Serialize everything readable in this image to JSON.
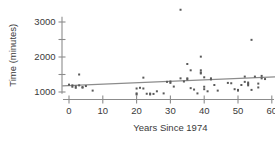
{
  "chart_data": {
    "type": "scatter",
    "title": "",
    "xlabel": "Years Since 1974",
    "ylabel": "Time (minutes)",
    "xlim": [
      -3,
      62
    ],
    "ylim": [
      700,
      3450
    ],
    "grid": false,
    "legend": "none",
    "x_ticks": [
      0,
      10,
      20,
      30,
      40,
      50,
      60
    ],
    "x_tick_labels": [
      "0",
      "10",
      "20",
      "30",
      "40",
      "50",
      "60"
    ],
    "y_ticks": [
      1000,
      1500,
      2000,
      2500,
      3000
    ],
    "y_tick_labels": [
      "1000",
      "",
      "2000",
      "",
      "3000"
    ],
    "y_major_labels": [
      "1000",
      "2000",
      "3000"
    ],
    "point_color": "#595959",
    "line_color": "#8c8c8c",
    "axis_color": "#8c8c8c",
    "trend_line": {
      "x": [
        -2,
        61
      ],
      "y": [
        1175,
        1430
      ],
      "slope": 4.05,
      "intercept": 1183
    },
    "points": [
      {
        "x": 0,
        "y": 1210
      },
      {
        "x": 1,
        "y": 1190
      },
      {
        "x": 1,
        "y": 1150
      },
      {
        "x": 2,
        "y": 1160
      },
      {
        "x": 2,
        "y": 1120
      },
      {
        "x": 3,
        "y": 1500
      },
      {
        "x": 3,
        "y": 1190
      },
      {
        "x": 4,
        "y": 1140
      },
      {
        "x": 4,
        "y": 1125
      },
      {
        "x": 5,
        "y": 1170
      },
      {
        "x": 7,
        "y": 1040
      },
      {
        "x": 20,
        "y": 1100
      },
      {
        "x": 20,
        "y": 960
      },
      {
        "x": 20,
        "y": 930
      },
      {
        "x": 21,
        "y": 1120
      },
      {
        "x": 22,
        "y": 1410
      },
      {
        "x": 22,
        "y": 1100
      },
      {
        "x": 23,
        "y": 950
      },
      {
        "x": 24,
        "y": 955
      },
      {
        "x": 24,
        "y": 930
      },
      {
        "x": 25,
        "y": 945
      },
      {
        "x": 26,
        "y": 1020
      },
      {
        "x": 28,
        "y": 960
      },
      {
        "x": 29,
        "y": 1290
      },
      {
        "x": 30,
        "y": 1300
      },
      {
        "x": 30,
        "y": 1260
      },
      {
        "x": 31,
        "y": 1155
      },
      {
        "x": 33,
        "y": 3350
      },
      {
        "x": 33,
        "y": 1390
      },
      {
        "x": 34,
        "y": 1300
      },
      {
        "x": 35,
        "y": 1800
      },
      {
        "x": 35,
        "y": 1390
      },
      {
        "x": 35,
        "y": 1360
      },
      {
        "x": 36,
        "y": 1620
      },
      {
        "x": 36,
        "y": 1110
      },
      {
        "x": 37,
        "y": 1070
      },
      {
        "x": 38,
        "y": 960
      },
      {
        "x": 39,
        "y": 2010
      },
      {
        "x": 39,
        "y": 1620
      },
      {
        "x": 39,
        "y": 1560
      },
      {
        "x": 39,
        "y": 1530
      },
      {
        "x": 40,
        "y": 1420
      },
      {
        "x": 40,
        "y": 1150
      },
      {
        "x": 40,
        "y": 1080
      },
      {
        "x": 41,
        "y": 1020
      },
      {
        "x": 42,
        "y": 1390
      },
      {
        "x": 42,
        "y": 1360
      },
      {
        "x": 43,
        "y": 1200
      },
      {
        "x": 44,
        "y": 1040
      },
      {
        "x": 47,
        "y": 1260
      },
      {
        "x": 48,
        "y": 1250
      },
      {
        "x": 49,
        "y": 1080
      },
      {
        "x": 50,
        "y": 1060
      },
      {
        "x": 50,
        "y": 1040
      },
      {
        "x": 51,
        "y": 1200
      },
      {
        "x": 52,
        "y": 1440
      },
      {
        "x": 52,
        "y": 1290
      },
      {
        "x": 53,
        "y": 1270
      },
      {
        "x": 53,
        "y": 1230
      },
      {
        "x": 53,
        "y": 1190
      },
      {
        "x": 54,
        "y": 2490
      },
      {
        "x": 54,
        "y": 1060
      },
      {
        "x": 55,
        "y": 1440
      },
      {
        "x": 56,
        "y": 1240
      },
      {
        "x": 56,
        "y": 1130
      },
      {
        "x": 57,
        "y": 1460
      },
      {
        "x": 57,
        "y": 1390
      },
      {
        "x": 58,
        "y": 1370
      }
    ]
  }
}
